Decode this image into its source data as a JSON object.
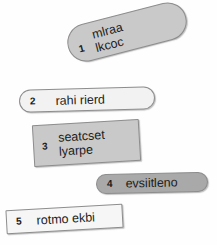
{
  "diagram": {
    "background_color": "#fefefe",
    "nodes": [
      {
        "number": "1",
        "label": "mlraa\nlkcoc",
        "shape": "pill",
        "fill": "#c9c9c9",
        "stroke": "#8d8d8d",
        "rotation_deg": -14.5
      },
      {
        "number": "2",
        "label": "rahi rierd",
        "shape": "pill",
        "fill": "#f2f2f2",
        "stroke": "#8d8d8d",
        "rotation_deg": -1.6
      },
      {
        "number": "3",
        "label": "seatcset\nlyarpe",
        "shape": "rect",
        "fill": "#c9c9c9",
        "stroke": "#8d8d8d",
        "rotation_deg": -3.4
      },
      {
        "number": "4",
        "label": "evsiitleno",
        "shape": "pill",
        "fill": "#a9a9a9",
        "stroke": "#8d8d8d",
        "rotation_deg": -1.2
      },
      {
        "number": "5",
        "label": "rotmo ekbi",
        "shape": "rect",
        "fill": "#f6f6f6",
        "stroke": "#8d8d8d",
        "rotation_deg": -3.2
      }
    ]
  }
}
